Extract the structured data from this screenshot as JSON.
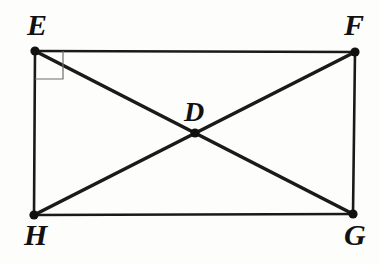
{
  "figure": {
    "kind": "geometry-diagram",
    "width": 379,
    "height": 264,
    "background_color": "#fdfdfc",
    "stroke_color": "#1a1a1a",
    "marker_color": "#6e6e6e"
  },
  "labels": {
    "E": "E",
    "F": "F",
    "D": "D",
    "H": "H",
    "G": "G"
  },
  "points": {
    "E": {
      "name": "E",
      "x": 35,
      "y": 51
    },
    "F": {
      "name": "F",
      "x": 355,
      "y": 52
    },
    "G": {
      "name": "G",
      "x": 353,
      "y": 214
    },
    "H": {
      "name": "H",
      "x": 34,
      "y": 215
    },
    "D": {
      "name": "D",
      "x": 195,
      "y": 133
    }
  },
  "segments": [
    {
      "name": "EF",
      "from": "E",
      "to": "F",
      "role": "rectangle-top",
      "width": 2.6
    },
    {
      "name": "FG",
      "from": "F",
      "to": "G",
      "role": "rectangle-right",
      "width": 2.6
    },
    {
      "name": "GH",
      "from": "G",
      "to": "H",
      "role": "rectangle-bottom",
      "width": 2.6
    },
    {
      "name": "HE",
      "from": "H",
      "to": "E",
      "role": "rectangle-left",
      "width": 2.6
    },
    {
      "name": "EG",
      "from": "E",
      "to": "G",
      "role": "diagonal",
      "width": 3.6
    },
    {
      "name": "FH",
      "from": "F",
      "to": "H",
      "role": "diagonal",
      "width": 3.6
    }
  ],
  "right_angle_marker": {
    "at_vertex": "E",
    "size": 28,
    "stroke_width": 1.2,
    "color": "#6e6e6e"
  },
  "vertex_dot": {
    "radius": 4.6,
    "color": "#111111"
  }
}
